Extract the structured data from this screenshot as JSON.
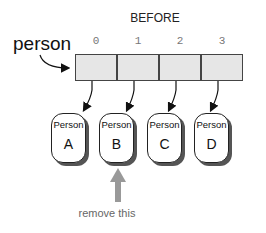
{
  "title": "BEFORE",
  "array": {
    "variable": "person",
    "indices": [
      "0",
      "1",
      "2",
      "3"
    ]
  },
  "objects": [
    {
      "type": "Person",
      "name": "A"
    },
    {
      "type": "Person",
      "name": "B"
    },
    {
      "type": "Person",
      "name": "C"
    },
    {
      "type": "Person",
      "name": "D"
    }
  ],
  "annotation": {
    "label": "remove this",
    "target_index": 1
  },
  "colors": {
    "cell_fill": "#e6e6e6",
    "annotation_arrow": "#999999"
  }
}
